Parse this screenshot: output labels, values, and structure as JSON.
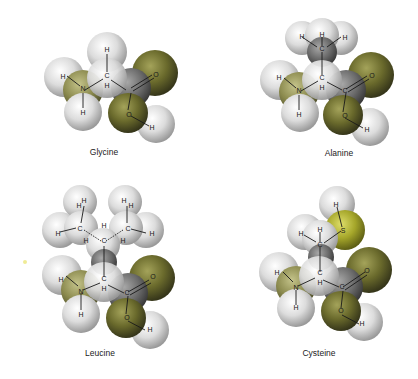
{
  "figure": {
    "type": "space-filling molecular models",
    "colors": {
      "hydrogen": "#e4e4e4",
      "carbon": "#6e6e6e",
      "nitrogen_oxygen": "#6d6d2e",
      "sulfur": "#a9ab2a",
      "background": "#ffffff"
    },
    "molecules": [
      {
        "name": "Glycine",
        "side_chain": "H"
      },
      {
        "name": "Alanine",
        "side_chain": "CH3"
      },
      {
        "name": "Leucine",
        "side_chain": "CH2-CH(CH3)2"
      },
      {
        "name": "Cysteine",
        "side_chain": "CH2-SH"
      }
    ]
  },
  "labels": {
    "glycine": "Glycine",
    "alanine": "Alanine",
    "leucine": "Leucine",
    "cysteine": "Cysteine"
  },
  "atoms": {
    "H": "H",
    "C": "C",
    "N": "N",
    "O": "O",
    "S": "S"
  }
}
